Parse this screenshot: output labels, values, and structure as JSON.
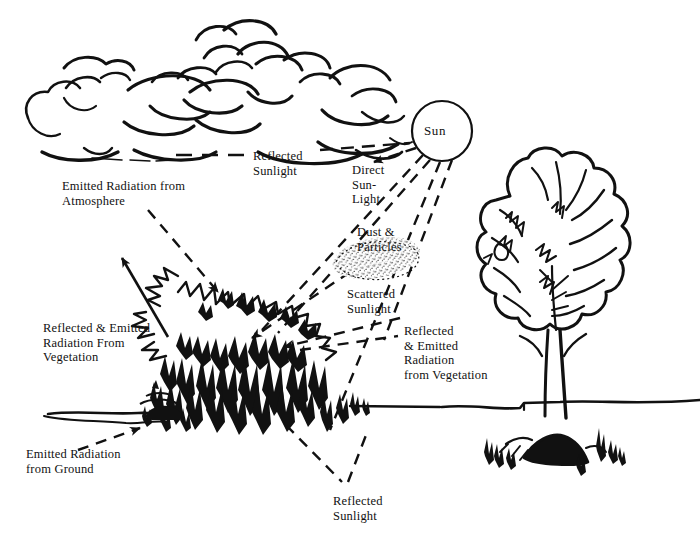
{
  "figure": {
    "style": "pen-and-ink line drawing, black on white"
  },
  "labels": {
    "sun": "Sun",
    "reflected_sunlight_top": "Reflected\nSunlight",
    "direct_sunlight": "Direct\nSun-\nLight",
    "emitted_radiation_atmosphere": "Emitted Radiation from\nAtmosphere",
    "dust_particles": "Dust &\nParticles",
    "scattered_sunlight": "Scattered\nSunlight",
    "reflected_emitted_vegetation_right": "Reflected\n& Emitted\nRadiation\nfrom Vegetation",
    "reflected_emitted_vegetation_left": "Reflected & Emitted\nRadiation From\nVegetation",
    "emitted_radiation_ground": "Emitted Radiation\nfrom Ground",
    "reflected_sunlight_bottom": "Reflected\nSunlight"
  },
  "label_positions": {
    "sun": {
      "x": 424,
      "y": 124
    },
    "reflected_sunlight_top": {
      "x": 253,
      "y": 149
    },
    "direct_sunlight": {
      "x": 352,
      "y": 163
    },
    "emitted_radiation_atmosphere": {
      "x": 62,
      "y": 179
    },
    "dust_particles": {
      "x": 357,
      "y": 225
    },
    "scattered_sunlight": {
      "x": 347,
      "y": 287
    },
    "reflected_emitted_vegetation_right": {
      "x": 404,
      "y": 324
    },
    "reflected_emitted_vegetation_left": {
      "x": 43,
      "y": 321
    },
    "emitted_radiation_ground": {
      "x": 26,
      "y": 447
    },
    "reflected_sunlight_bottom": {
      "x": 333,
      "y": 494
    }
  },
  "scene_elements": {
    "clouds": "cumulus cloud bank across upper left and upper middle",
    "sun_disc": {
      "cx": 442,
      "cy": 131,
      "r": 30
    },
    "dust_cloud": "stippled lens-shaped dust and particle cloud in mid air",
    "shrub": "dark scrub bush at centre-left on horizon",
    "tree": "large deciduous tree at right",
    "horizon": "ground line running full width"
  },
  "colors": {
    "ink": "#111111",
    "paper": "#ffffff"
  },
  "caption": {
    "text": "                                                                                                                              "
  }
}
